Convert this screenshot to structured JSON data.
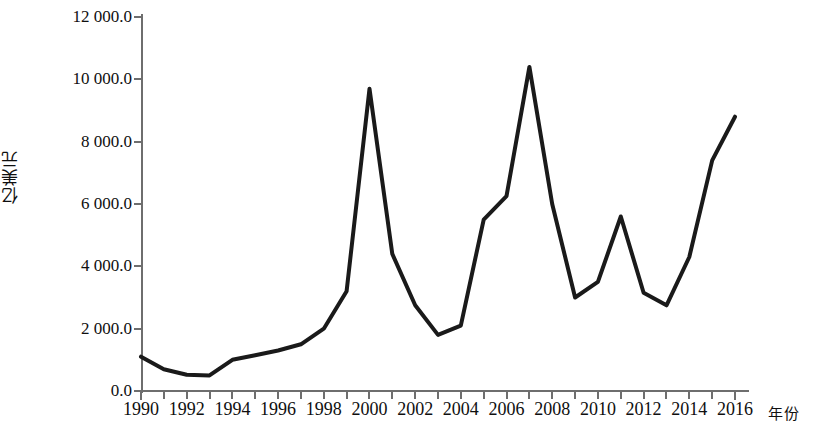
{
  "chart_data": {
    "type": "line",
    "title": "",
    "xlabel": "年份",
    "ylabel": "亿美元",
    "xlim": [
      1990,
      2016
    ],
    "ylim": [
      0,
      12000
    ],
    "grid": false,
    "legend": false,
    "y_ticks": [
      "0.0",
      "2 000.0",
      "4 000.0",
      "6 000.0",
      "8 000.0",
      "10 000.0",
      "12 000.0"
    ],
    "y_tick_values": [
      0,
      2000,
      4000,
      6000,
      8000,
      10000,
      12000
    ],
    "x_ticks": [
      "1990",
      "1992",
      "1994",
      "1996",
      "1998",
      "2000",
      "2002",
      "2004",
      "2006",
      "2008",
      "2010",
      "2012",
      "2014",
      "2016"
    ],
    "x_tick_values": [
      1990,
      1992,
      1994,
      1996,
      1998,
      2000,
      2002,
      2004,
      2006,
      2008,
      2010,
      2012,
      2014,
      2016
    ],
    "x_minor_values": [
      1990,
      1991,
      1992,
      1993,
      1994,
      1995,
      1996,
      1997,
      1998,
      1999,
      2000,
      2001,
      2002,
      2003,
      2004,
      2005,
      2006,
      2007,
      2008,
      2009,
      2010,
      2011,
      2012,
      2013,
      2014,
      2015,
      2016
    ],
    "x": [
      1990,
      1991,
      1992,
      1993,
      1994,
      1995,
      1996,
      1997,
      1998,
      1999,
      2000,
      2001,
      2002,
      2003,
      2004,
      2005,
      2006,
      2007,
      2008,
      2009,
      2010,
      2011,
      2012,
      2013,
      2014,
      2015,
      2016
    ],
    "values": [
      1100,
      700,
      520,
      500,
      1000,
      1150,
      1300,
      1500,
      2000,
      3200,
      9700,
      4400,
      2750,
      1800,
      2100,
      5500,
      6250,
      10400,
      6000,
      3000,
      3500,
      5600,
      3150,
      2750,
      4300,
      7400,
      8800
    ],
    "series": [
      {
        "name": "亿美元",
        "color": "#1a1a1a",
        "values": [
          1100,
          700,
          520,
          500,
          1000,
          1150,
          1300,
          1500,
          2000,
          3200,
          9700,
          4400,
          2750,
          1800,
          2100,
          5500,
          6250,
          10400,
          6000,
          3000,
          3500,
          5600,
          3150,
          2750,
          4300,
          7400,
          8800
        ]
      }
    ],
    "line_color": "#1a1a1a",
    "line_width": 4,
    "axis_color": "#6e6e6e",
    "background": "#ffffff"
  }
}
